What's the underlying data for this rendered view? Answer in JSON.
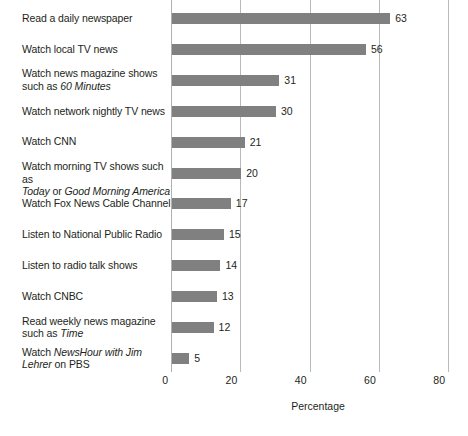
{
  "chart_data": {
    "type": "bar",
    "orientation": "horizontal",
    "title": "",
    "xlabel": "Percentage",
    "ylabel": "",
    "xlim": [
      0,
      80
    ],
    "xticks": [
      0,
      20,
      40,
      60,
      80
    ],
    "grid": "vertical",
    "legend": "none",
    "bar_color": "#808080",
    "gridline_color": "#b9b9b9",
    "categories": [
      "Read a daily newspaper",
      "Watch local TV news",
      "Watch news magazine shows such as 60 Minutes",
      "Watch network nightly TV news",
      "Watch CNN",
      "Watch morning TV shows such as Today or Good Morning America",
      "Watch Fox News Cable Channel",
      "Listen to National Public Radio",
      "Listen to radio talk shows",
      "Watch CNBC",
      "Read weekly news magazine such as Time",
      "Watch NewsHour with Jim Lehrer on PBS"
    ],
    "values": [
      63,
      56,
      31,
      30,
      21,
      20,
      17,
      15,
      14,
      13,
      12,
      5
    ],
    "value_labels": [
      "63",
      "56",
      "31",
      "30",
      "21",
      "20",
      "17",
      "15",
      "14",
      "13",
      "12",
      "5"
    ],
    "tick_labels": [
      "0",
      "20",
      "40",
      "60",
      "80"
    ],
    "rows": [
      {
        "value": 63,
        "value_label": "63",
        "lines": [
          [
            {
              "t": "Read a daily newspaper",
              "i": false
            }
          ]
        ]
      },
      {
        "value": 56,
        "value_label": "56",
        "lines": [
          [
            {
              "t": "Watch local TV news",
              "i": false
            }
          ]
        ]
      },
      {
        "value": 31,
        "value_label": "31",
        "lines": [
          [
            {
              "t": "Watch news magazine shows",
              "i": false
            }
          ],
          [
            {
              "t": "such as ",
              "i": false
            },
            {
              "t": "60 Minutes",
              "i": true
            }
          ]
        ]
      },
      {
        "value": 30,
        "value_label": "30",
        "lines": [
          [
            {
              "t": "Watch network nightly TV news",
              "i": false
            }
          ]
        ]
      },
      {
        "value": 21,
        "value_label": "21",
        "lines": [
          [
            {
              "t": "Watch CNN",
              "i": false
            }
          ]
        ]
      },
      {
        "value": 20,
        "value_label": "20",
        "lines": [
          [
            {
              "t": "Watch morning TV shows such as",
              "i": false
            }
          ],
          [
            {
              "t": "Today",
              "i": true
            },
            {
              "t": " or ",
              "i": false
            },
            {
              "t": "Good Morning America",
              "i": true
            }
          ]
        ]
      },
      {
        "value": 17,
        "value_label": "17",
        "lines": [
          [
            {
              "t": "Watch Fox News Cable Channel",
              "i": false
            }
          ]
        ]
      },
      {
        "value": 15,
        "value_label": "15",
        "lines": [
          [
            {
              "t": "Listen to National Public Radio",
              "i": false
            }
          ]
        ]
      },
      {
        "value": 14,
        "value_label": "14",
        "lines": [
          [
            {
              "t": "Listen to radio talk shows",
              "i": false
            }
          ]
        ]
      },
      {
        "value": 13,
        "value_label": "13",
        "lines": [
          [
            {
              "t": "Watch CNBC",
              "i": false
            }
          ]
        ]
      },
      {
        "value": 12,
        "value_label": "12",
        "lines": [
          [
            {
              "t": "Read weekly news magazine",
              "i": false
            }
          ],
          [
            {
              "t": "such as ",
              "i": false
            },
            {
              "t": "Time",
              "i": true
            }
          ]
        ]
      },
      {
        "value": 5,
        "value_label": "5",
        "lines": [
          [
            {
              "t": "Watch ",
              "i": false
            },
            {
              "t": "NewsHour with Jim",
              "i": true
            }
          ],
          [
            {
              "t": "Lehrer",
              "i": true
            },
            {
              "t": " on PBS",
              "i": false
            }
          ]
        ]
      }
    ]
  }
}
